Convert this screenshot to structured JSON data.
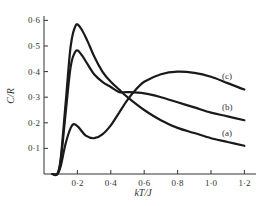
{
  "chart_data": {
    "type": "line",
    "title": "",
    "xlabel": "kT/J",
    "ylabel": "C/R",
    "xlim": [
      0,
      1.25
    ],
    "ylim": [
      0,
      0.6
    ],
    "grid": false,
    "legend_position": "inline labels at right end of curves",
    "x_ticks": [
      "0·2",
      "0·4",
      "0·6",
      "0·8",
      "1·0",
      "1·2"
    ],
    "y_ticks": [
      "0·1",
      "0·2",
      "0·3",
      "0·4",
      "0·5",
      "0·6"
    ],
    "series": [
      {
        "name": "(a)",
        "x": [
          0.05,
          0.08,
          0.1,
          0.13,
          0.16,
          0.19,
          0.22,
          0.26,
          0.3,
          0.35,
          0.4,
          0.45,
          0.5,
          0.6,
          0.7,
          0.8,
          0.9,
          1.0,
          1.1,
          1.2
        ],
        "y": [
          0.0,
          0.0,
          0.06,
          0.28,
          0.5,
          0.58,
          0.57,
          0.52,
          0.46,
          0.4,
          0.36,
          0.33,
          0.3,
          0.25,
          0.21,
          0.18,
          0.16,
          0.14,
          0.125,
          0.11
        ]
      },
      {
        "name": "(b)",
        "x": [
          0.05,
          0.08,
          0.1,
          0.13,
          0.16,
          0.19,
          0.22,
          0.26,
          0.3,
          0.35,
          0.4,
          0.45,
          0.5,
          0.6,
          0.7,
          0.8,
          0.9,
          1.0,
          1.1,
          1.2
        ],
        "y": [
          0.0,
          0.0,
          0.05,
          0.24,
          0.42,
          0.48,
          0.47,
          0.43,
          0.39,
          0.36,
          0.34,
          0.32,
          0.32,
          0.315,
          0.3,
          0.28,
          0.26,
          0.24,
          0.225,
          0.21
        ]
      },
      {
        "name": "(c)",
        "x": [
          0.05,
          0.08,
          0.1,
          0.13,
          0.16,
          0.18,
          0.21,
          0.25,
          0.3,
          0.35,
          0.4,
          0.45,
          0.5,
          0.55,
          0.6,
          0.7,
          0.8,
          0.9,
          1.0,
          1.1,
          1.2
        ],
        "y": [
          0.0,
          0.0,
          0.03,
          0.12,
          0.18,
          0.195,
          0.18,
          0.15,
          0.14,
          0.155,
          0.19,
          0.24,
          0.29,
          0.33,
          0.36,
          0.39,
          0.4,
          0.395,
          0.38,
          0.355,
          0.33
        ]
      }
    ]
  },
  "axes": {
    "xlabel": "kT/J",
    "ylabel": "C/R"
  },
  "labels": {
    "a": "(a)",
    "b": "(b)",
    "c": "(c)"
  }
}
